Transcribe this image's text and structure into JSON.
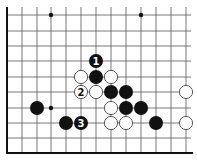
{
  "diagram": {
    "type": "go-board-fragment",
    "columns_x": [
      7,
      22,
      37,
      51,
      66,
      81,
      96,
      111,
      126,
      141,
      156,
      171,
      186
    ],
    "rows_y": [
      15,
      31,
      46,
      61,
      77,
      92,
      108,
      123,
      138,
      153
    ],
    "left_edge": true,
    "bottom_edge": true,
    "line_right_end": 191,
    "star_points": [
      {
        "col": 3,
        "row": 0
      },
      {
        "col": 9,
        "row": 0
      },
      {
        "col": 3,
        "row": 6
      }
    ],
    "stones": [
      {
        "color": "black",
        "col": 6,
        "row": 3,
        "label": "1"
      },
      {
        "color": "white",
        "col": 5,
        "row": 4,
        "label": ""
      },
      {
        "color": "black",
        "col": 6,
        "row": 4,
        "label": ""
      },
      {
        "color": "white",
        "col": 7,
        "row": 4,
        "label": ""
      },
      {
        "color": "white",
        "col": 5,
        "row": 5,
        "label": "2"
      },
      {
        "color": "white",
        "col": 6,
        "row": 5,
        "label": ""
      },
      {
        "color": "black",
        "col": 7,
        "row": 5,
        "label": ""
      },
      {
        "color": "black",
        "col": 8,
        "row": 5,
        "label": ""
      },
      {
        "color": "white",
        "col": 12,
        "row": 5,
        "label": ""
      },
      {
        "color": "black",
        "col": 2,
        "row": 6,
        "label": ""
      },
      {
        "color": "white",
        "col": 7,
        "row": 6,
        "label": ""
      },
      {
        "color": "black",
        "col": 8,
        "row": 6,
        "label": ""
      },
      {
        "color": "black",
        "col": 9,
        "row": 6,
        "label": ""
      },
      {
        "color": "black",
        "col": 4,
        "row": 7,
        "label": ""
      },
      {
        "color": "black",
        "col": 5,
        "row": 7,
        "label": "3"
      },
      {
        "color": "white",
        "col": 7,
        "row": 7,
        "label": ""
      },
      {
        "color": "white",
        "col": 8,
        "row": 7,
        "label": ""
      },
      {
        "color": "black",
        "col": 10,
        "row": 7,
        "label": ""
      },
      {
        "color": "white",
        "col": 12,
        "row": 7,
        "label": ""
      }
    ],
    "move_labels": [
      "1",
      "2",
      "3"
    ],
    "colors": {
      "line": "#555555",
      "edge": "#111111",
      "black_stone": "#111111",
      "white_stone": "#ffffff",
      "white_stroke": "#333333",
      "background": "#ffffff"
    }
  }
}
